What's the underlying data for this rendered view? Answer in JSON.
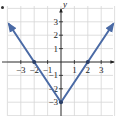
{
  "chart_data": {
    "type": "line",
    "title": "",
    "equation_implied": "y = 1.5|x| - 3",
    "xlabel": "",
    "ylabel": "y",
    "xlim": [
      -3.9,
      3.9
    ],
    "ylim": [
      -4,
      4
    ],
    "grid": true,
    "x_ticks": [
      -3,
      -2,
      -1,
      1,
      2,
      3
    ],
    "y_ticks": [
      3,
      2,
      1,
      -1,
      -2,
      -3
    ],
    "x_tick_labels": [
      "-3",
      "-2",
      "-1",
      "1",
      "2",
      "3"
    ],
    "y_tick_labels": [
      "3",
      "2",
      "1",
      "-1",
      "-2",
      "-3"
    ],
    "series": [
      {
        "name": "V-shaped graph",
        "color": "#4a6aa5",
        "points": [
          [
            -3.9,
            2.85
          ],
          [
            -2,
            0
          ],
          [
            0,
            -3
          ],
          [
            2,
            0
          ],
          [
            3.9,
            2.85
          ]
        ],
        "arrows_at_ends": true
      }
    ],
    "highlighted_points": [
      [
        -2,
        0
      ],
      [
        0,
        -3
      ],
      [
        2,
        0
      ]
    ],
    "legend": []
  },
  "colors": {
    "line": "#4a6aa5",
    "axis": "#222222",
    "grid": "#d6d6d6",
    "point": "#2c3f66"
  },
  "labels": {
    "y_axis": "y"
  }
}
